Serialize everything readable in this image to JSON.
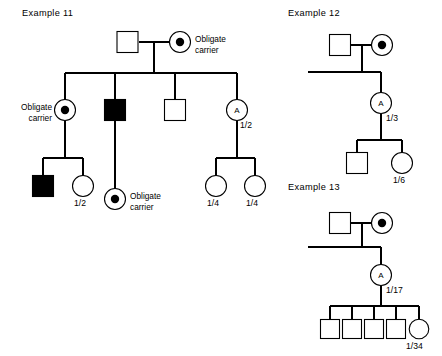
{
  "figure": {
    "type": "pedigree-chart",
    "background_color": "#ffffff",
    "line_color": "#000000"
  },
  "examples": [
    {
      "id": "example-11",
      "title": "Example 11",
      "title_pos": [
        22,
        13
      ],
      "generations": [
        {
          "id": "gen-1",
          "members": [
            {
              "name": "father",
              "shape": "square",
              "filled": false,
              "carrier": false,
              "cx": 128,
              "cy": 42
            },
            {
              "name": "mother",
              "shape": "circle",
              "filled": false,
              "carrier": true,
              "cx": 180,
              "cy": 42,
              "label": "Obligate\ncarrier"
            }
          ]
        },
        {
          "id": "gen-2",
          "members": [
            {
              "name": "daughter-carrier",
              "shape": "circle",
              "filled": false,
              "carrier": true,
              "cx": 65,
              "cy": 110,
              "label": "Obligate\ncarrier"
            },
            {
              "name": "son-affected",
              "shape": "square",
              "filled": true,
              "carrier": false,
              "cx": 115,
              "cy": 110
            },
            {
              "name": "son-unaffected",
              "shape": "square",
              "filled": false,
              "carrier": false,
              "cx": 175,
              "cy": 110
            },
            {
              "name": "daughter-a",
              "shape": "circle",
              "filled": false,
              "carrier": false,
              "cx": 237,
              "cy": 110,
              "inner_text": "A",
              "risk": "1/2"
            }
          ]
        },
        {
          "id": "gen-3",
          "members": [
            {
              "name": "grandson-affected",
              "shape": "square",
              "filled": true,
              "carrier": false,
              "cx": 43,
              "cy": 186
            },
            {
              "name": "granddaughter-risk",
              "shape": "circle",
              "filled": false,
              "carrier": false,
              "cx": 83,
              "cy": 186,
              "risk": "1/2"
            },
            {
              "name": "grandchild-carrier",
              "shape": "circle",
              "filled": false,
              "carrier": true,
              "cx": 115,
              "cy": 199,
              "label": "Obligate\ncarrier"
            },
            {
              "name": "granddaughter-risk-left",
              "shape": "circle",
              "filled": false,
              "carrier": false,
              "cx": 216,
              "cy": 186,
              "risk": "1/4"
            },
            {
              "name": "granddaughter-risk-right",
              "shape": "circle",
              "filled": false,
              "carrier": false,
              "cx": 255,
              "cy": 186,
              "risk": "1/4"
            }
          ]
        }
      ]
    },
    {
      "id": "example-12",
      "title": "Example 12",
      "title_pos": [
        288,
        13
      ],
      "generations": [
        {
          "id": "gen-1",
          "members": [
            {
              "name": "father",
              "shape": "square",
              "filled": false,
              "carrier": false,
              "cx": 340,
              "cy": 45
            },
            {
              "name": "mother",
              "shape": "circle",
              "filled": false,
              "carrier": true,
              "cx": 382,
              "cy": 45
            }
          ]
        },
        {
          "id": "gen-2",
          "members": [
            {
              "name": "daughter-a",
              "shape": "circle",
              "filled": false,
              "carrier": false,
              "cx": 381,
              "cy": 103,
              "inner_text": "A",
              "risk": "1/3"
            }
          ]
        },
        {
          "id": "gen-3",
          "members": [
            {
              "name": "grandson",
              "shape": "square",
              "filled": false,
              "carrier": false,
              "cx": 357,
              "cy": 163
            },
            {
              "name": "granddaughter",
              "shape": "circle",
              "filled": false,
              "carrier": false,
              "cx": 402,
              "cy": 163,
              "risk": "1/6"
            }
          ]
        }
      ]
    },
    {
      "id": "example-13",
      "title": "Example 13",
      "title_pos": [
        288,
        187
      ],
      "generations": [
        {
          "id": "gen-1",
          "members": [
            {
              "name": "father",
              "shape": "square",
              "filled": false,
              "carrier": false,
              "cx": 340,
              "cy": 223
            },
            {
              "name": "mother",
              "shape": "circle",
              "filled": false,
              "carrier": true,
              "cx": 382,
              "cy": 223
            }
          ]
        },
        {
          "id": "gen-2",
          "members": [
            {
              "name": "daughter-a",
              "shape": "circle",
              "filled": false,
              "carrier": false,
              "cx": 381,
              "cy": 275,
              "inner_text": "A",
              "risk": "1/17"
            }
          ]
        },
        {
          "id": "gen-3",
          "members": [
            {
              "name": "grandson-1",
              "shape": "square",
              "filled": false,
              "carrier": false,
              "cx": 330,
              "cy": 330
            },
            {
              "name": "grandson-2",
              "shape": "square",
              "filled": false,
              "carrier": false,
              "cx": 352,
              "cy": 330
            },
            {
              "name": "grandson-3",
              "shape": "square",
              "filled": false,
              "carrier": false,
              "cx": 374,
              "cy": 330
            },
            {
              "name": "grandson-4",
              "shape": "square",
              "filled": false,
              "carrier": false,
              "cx": 396,
              "cy": 330
            },
            {
              "name": "granddaughter",
              "shape": "circle",
              "filled": false,
              "carrier": false,
              "cx": 419,
              "cy": 330,
              "risk": "1/34"
            }
          ]
        }
      ]
    }
  ],
  "labels": {
    "example_11_title": "Example 11",
    "example_12_title": "Example 12",
    "example_13_title": "Example 13",
    "obligate_carrier_top": "Obligate\ncarrier",
    "obligate_carrier_top_line1": "Obligate",
    "obligate_carrier_top_line2": "carrier",
    "obligate_carrier_left_line1": "Obligate",
    "obligate_carrier_left_line2": "carrier",
    "obligate_carrier_mid_line1": "Obligate",
    "obligate_carrier_mid_line2": "carrier",
    "letter_a": "A",
    "risk_e11_gen2": "1/2",
    "risk_e11_gen3_left": "1/2",
    "risk_e11_gen3_mid": "1/4",
    "risk_e11_gen3_right": "1/4",
    "risk_e12_gen2": "1/3",
    "risk_e12_gen3": "1/6",
    "risk_e13_gen2": "1/17",
    "risk_e13_gen3": "1/34"
  }
}
